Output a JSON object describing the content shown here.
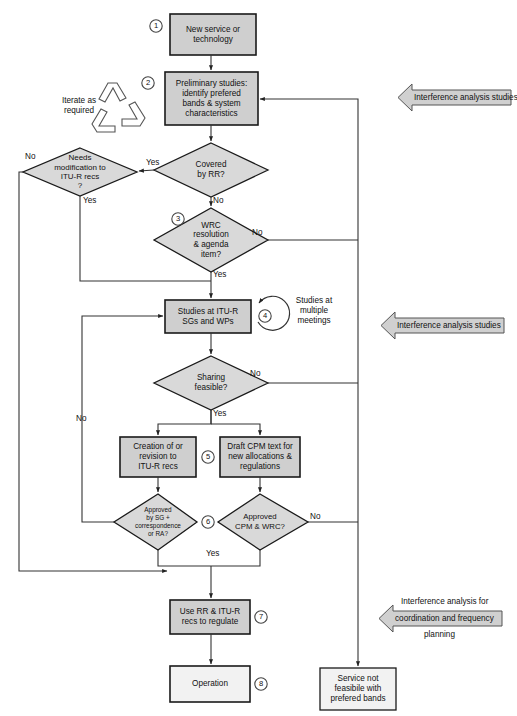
{
  "diagram": {
    "colors": {
      "process_fill": "#cfcfcf",
      "decision_fill": "#d9d9d9",
      "plain_fill": "#f2f2f2",
      "annotation_fill": "#d0d0d0",
      "stroke": "#1a1a1a",
      "line": "#3a3a3a"
    },
    "nodes": [
      {
        "id": "n1",
        "kind": "process",
        "marker": "1",
        "text": "New service or\ntechnology"
      },
      {
        "id": "n2",
        "kind": "process",
        "marker": "2",
        "text": "Preliminary studies:\nidentify prefered\nbands & system\ncharacteristics"
      },
      {
        "id": "d_covered",
        "kind": "decision",
        "marker": "",
        "text": "Covered\nby RR?"
      },
      {
        "id": "d_needs",
        "kind": "decision",
        "marker": "",
        "text": "Needs\nmodification to\nITU-R recs\n?"
      },
      {
        "id": "d_wrc",
        "kind": "decision",
        "marker": "3",
        "text": "WRC\nresolution\n& agenda\nitem?"
      },
      {
        "id": "n4",
        "kind": "process",
        "marker": "4",
        "text": "Studies at ITU-R\nSGs and WPs"
      },
      {
        "id": "d_sharing",
        "kind": "decision",
        "marker": "",
        "text": "Sharing\nfeasible?"
      },
      {
        "id": "n5a",
        "kind": "process",
        "marker": "",
        "text": "Creation of or\nrevision to\nITU-R recs"
      },
      {
        "id": "n5b",
        "kind": "process",
        "marker": "5",
        "text": "Draft CPM text for\nnew allocations &\nregulations"
      },
      {
        "id": "d_approved_sg",
        "kind": "decision",
        "marker": "",
        "text": "Approved\nby SG +\ncorrespondence\nor RA?"
      },
      {
        "id": "d_approved_cpm",
        "kind": "decision",
        "marker": "6",
        "text": "Approved\nCPM & WRC?"
      },
      {
        "id": "n7",
        "kind": "process",
        "marker": "7",
        "text": "Use RR & ITU-R\nrecs to regulate"
      },
      {
        "id": "n8",
        "kind": "plain",
        "marker": "8",
        "text": "Operation"
      },
      {
        "id": "n_fail",
        "kind": "plain",
        "marker": "",
        "text": "Service not\nfeasibile with\nprefered bands"
      }
    ],
    "edge_labels": {
      "covered_yes": "Yes",
      "covered_no": "No",
      "needs_no": "No",
      "needs_yes": "Yes",
      "wrc_no": "No",
      "wrc_yes": "Yes",
      "sharing_no": "No",
      "sharing_yes": "Yes",
      "approved_sg_no": "No",
      "approved_cpm_no": "No",
      "approved_yes": "Yes"
    },
    "side_notes": {
      "iterate": "Iterate as\nrequired",
      "multiple_meetings": "Studies at\nmultiple\nmeetings"
    },
    "annotations": [
      {
        "id": "a1",
        "text": "Interference analysis studies",
        "above": "",
        "below": ""
      },
      {
        "id": "a2",
        "text": "Interference analysis studies",
        "above": "",
        "below": ""
      },
      {
        "id": "a3",
        "text": "coordination and frequency",
        "above": "Interference analysis for",
        "below": "planning"
      }
    ],
    "markers": [
      "1",
      "2",
      "3",
      "4",
      "5",
      "6",
      "7",
      "8"
    ]
  }
}
